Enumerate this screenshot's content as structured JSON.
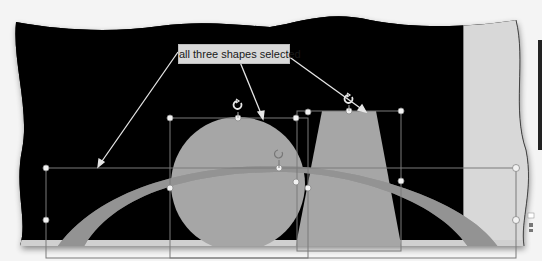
{
  "callout": {
    "label": "all three shapes selected"
  },
  "slide": {
    "background_color": "#000000",
    "shape_fill_color": "#a6a6a6",
    "side_panel_color": "#d8d8d8",
    "selection_line_color": "#8c8c8c",
    "handle_color": "#f2f2f2"
  },
  "shapes": [
    {
      "name": "arc",
      "type": "block-arc"
    },
    {
      "name": "circle",
      "type": "oval"
    },
    {
      "name": "trapezoid",
      "type": "trapezoid"
    }
  ],
  "icons": {
    "rotate_handle": "rotate-icon",
    "sizing_handle": "handle-icon"
  }
}
